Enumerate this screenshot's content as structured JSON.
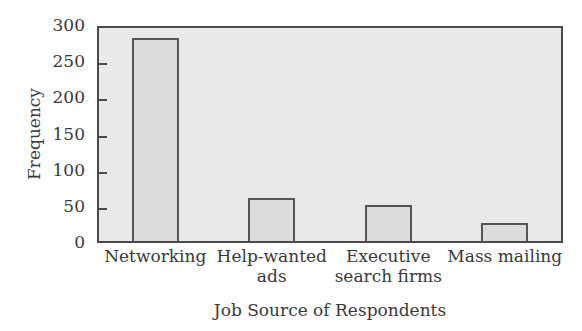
{
  "chart_data": {
    "type": "bar",
    "title": "",
    "xlabel": "Job Source of Respondents",
    "ylabel": "Frequency",
    "categories": [
      "Networking",
      "Help-wanted ads",
      "Executive search firms",
      "Mass mailing"
    ],
    "category_lines": [
      [
        "Networking"
      ],
      [
        "Help-wanted",
        "ads"
      ],
      [
        "Executive",
        "search firms"
      ],
      [
        "Mass mailing"
      ]
    ],
    "values": [
      280,
      60,
      50,
      25
    ],
    "ylim": [
      0,
      300
    ],
    "yticks": [
      0,
      50,
      100,
      150,
      200,
      250,
      300
    ],
    "grid": false,
    "legend": null,
    "colors": {
      "plot_bg": "#e9e9e9",
      "bar_fill": "#dcdcdc",
      "bar_border": "#555555",
      "axis": "#4a4a4a"
    }
  }
}
